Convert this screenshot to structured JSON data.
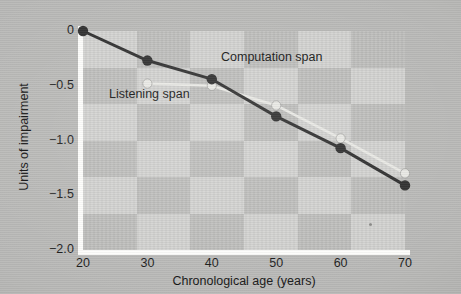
{
  "chart_data": {
    "type": "line",
    "title": "",
    "xlabel": "Chronological age (years)",
    "ylabel": "Units of impairment",
    "x": [
      20,
      30,
      40,
      50,
      60,
      70
    ],
    "xtick_labels": [
      "20",
      "30",
      "40",
      "50",
      "60",
      "70"
    ],
    "ytick_labels": [
      "0",
      "-0.5",
      "-1.0",
      "-1.5",
      "-2.0"
    ],
    "ytick_values": [
      0,
      -0.5,
      -1.0,
      -1.5,
      -2.0
    ],
    "xlim": [
      20,
      70
    ],
    "ylim": [
      -2.0,
      0
    ],
    "grid": false,
    "legend_position": "inline-annotations",
    "series": [
      {
        "name": "Computation span",
        "color": "#2e2e2e",
        "marker": "filled-circle",
        "x": [
          20,
          30,
          40,
          50,
          60,
          70
        ],
        "values": [
          0,
          -0.27,
          -0.44,
          -0.78,
          -1.07,
          -1.41
        ]
      },
      {
        "name": "Listening span",
        "color": "#e8e8e4",
        "marker": "open-circle",
        "x": [
          30,
          40,
          50,
          60,
          70
        ],
        "values": [
          -0.48,
          -0.5,
          -0.68,
          -0.98,
          -1.3
        ]
      }
    ],
    "annotations": [
      {
        "text": "Computation span",
        "x": 41.5,
        "y": -0.17
      },
      {
        "text": "Listening span",
        "x": 24.0,
        "y": -0.51
      }
    ]
  },
  "axes": {
    "y_title": "Units of impairment",
    "x_title": "Chronological age (years)",
    "y_ticks": [
      {
        "label": "0",
        "value": 0
      },
      {
        "label": "-0.5",
        "value": -0.5
      },
      {
        "label": "-1.0",
        "value": -1.0
      },
      {
        "label": "-1.5",
        "value": -1.5
      },
      {
        "label": "-2.0",
        "value": -2.0
      }
    ],
    "x_ticks": [
      {
        "label": "20",
        "value": 20
      },
      {
        "label": "30",
        "value": 30
      },
      {
        "label": "40",
        "value": 40
      },
      {
        "label": "50",
        "value": 50
      },
      {
        "label": "60",
        "value": 60
      },
      {
        "label": "70",
        "value": 70
      }
    ]
  },
  "labels": {
    "computation_span": "Computation span",
    "listening_span": "Listening span"
  },
  "colors": {
    "figure_background": "#b9b9b7",
    "plot_background": "#bdbdbb",
    "plot_checker_light": "#d2d2d0",
    "axis_rail": "#fdfdfb",
    "dark_series": "#2e2e2e",
    "light_series": "#e8e8e4",
    "text": "#141414"
  }
}
